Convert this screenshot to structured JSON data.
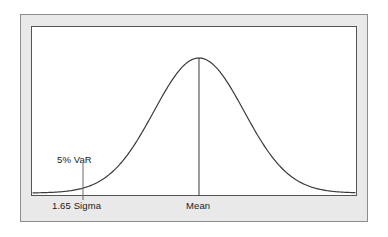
{
  "figure": {
    "name": "normal-distribution-var-diagram",
    "frame": {
      "outer_border_color": "#8c8c8c",
      "mat_color": "#e9e9e9",
      "plot_border_color": "#555555",
      "plot_background": "#ffffff"
    }
  },
  "labels": {
    "var": "5% VaR",
    "sigma": "1.65 Sigma",
    "mean": "Mean"
  },
  "chart_data": {
    "type": "line",
    "title": "",
    "subtitle": "",
    "xlabel": "",
    "ylabel": "",
    "grid": false,
    "legend": null,
    "curve": {
      "name": "normal-density",
      "distribution": "normal",
      "mean_x": 199,
      "sigma_px": 45,
      "baseline_y": 193,
      "peak_y": 58,
      "x_start": 33,
      "x_end": 355,
      "stroke": "#3a3a3a",
      "stroke_width": 1.2
    },
    "annotations": [
      {
        "name": "mean-line",
        "label": "Mean",
        "x": 199,
        "y_top": 58,
        "y_bottom": 196,
        "stroke": "#3a3a3a"
      },
      {
        "name": "var-tick",
        "label": "5% VaR",
        "sublabel": "1.65 Sigma",
        "x": 83,
        "y_top": 163,
        "y_bottom": 200,
        "stroke": "#6a6a6a",
        "sigma_offset": -1.65,
        "tail_probability_percent": 5
      }
    ],
    "axis": {
      "baseline_y": 193,
      "x_left": 33,
      "x_right": 355,
      "stroke": "#555555"
    }
  }
}
